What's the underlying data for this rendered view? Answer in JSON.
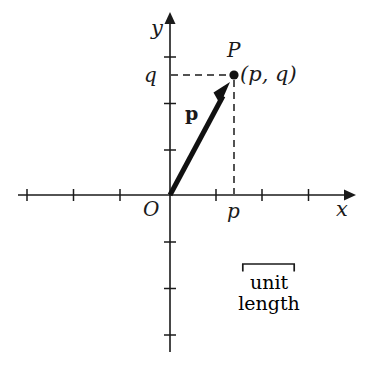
{
  "figure": {
    "type": "cartesian-vector-diagram",
    "background_color": "#ffffff",
    "ink_color": "#1a1a1a"
  },
  "axes": {
    "x_axis": {
      "label": "x",
      "origin_x": 170,
      "y": 195,
      "start_x": 18,
      "end_x": 355,
      "arrow": "right",
      "tick_positions": [
        27,
        73,
        120,
        215,
        261,
        308
      ],
      "tick_spacing": 46.7
    },
    "y_axis": {
      "label": "y",
      "x": 170,
      "origin_y": 195,
      "start_y": 14,
      "end_y": 352,
      "arrow": "up",
      "tick_positions": [
        57,
        103,
        150,
        242,
        288,
        335
      ],
      "tick_spacing": 46.7
    }
  },
  "labels": {
    "origin": "O",
    "x_axis": "x",
    "y_axis": "y",
    "p_tick": "p",
    "q_tick": "q",
    "point": "P",
    "coordinates": "(p, q)",
    "vector": "p"
  },
  "point_P": {
    "name": "P",
    "coordinates_text": "(p, q)",
    "pixel_x": 234,
    "pixel_y": 75,
    "dot_radius": 4.6
  },
  "vector": {
    "label": "p",
    "style": "bold",
    "from_x": 170,
    "from_y": 195,
    "to_x": 229,
    "to_y": 86,
    "stroke_width": 5
  },
  "guide_lines": {
    "horizontal": {
      "from_x": 172,
      "to_x": 232,
      "y": 75,
      "style": "dashed"
    },
    "vertical": {
      "x": 234,
      "from_y": 80,
      "to_y": 194,
      "style": "dashed"
    }
  },
  "unit_length": {
    "caption_line_1": "unit",
    "caption_line_2": "length",
    "bracket_left_x": 242,
    "bracket_right_x": 295,
    "bracket_y": 264,
    "bracket_width": 53
  }
}
